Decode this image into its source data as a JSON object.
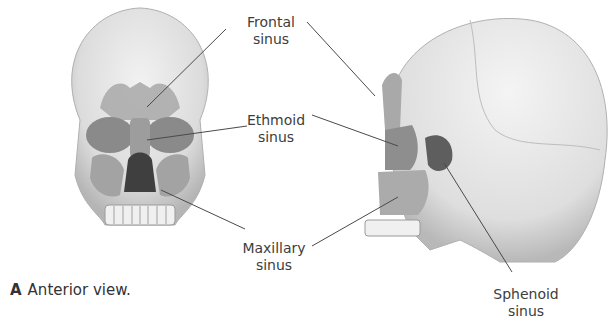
{
  "figure": {
    "panel_a": {
      "letter": "A",
      "caption": "Anterior view."
    },
    "labels": {
      "frontal": {
        "line1": "Frontal",
        "line2": "sinus"
      },
      "ethmoid": {
        "line1": "Ethmoid",
        "line2": "sinus"
      },
      "maxillary": {
        "line1": "Maxillary",
        "line2": "sinus"
      },
      "sphenoid": {
        "line1": "Sphenoid",
        "line2": "sinus"
      }
    },
    "colors": {
      "bone": "#e6e6e6",
      "bone_shadow": "#c8c8c8",
      "sinus": "#9a9a9a",
      "sinus_dark": "#6b6b6b",
      "leader_line": "#4a4a4a"
    }
  }
}
